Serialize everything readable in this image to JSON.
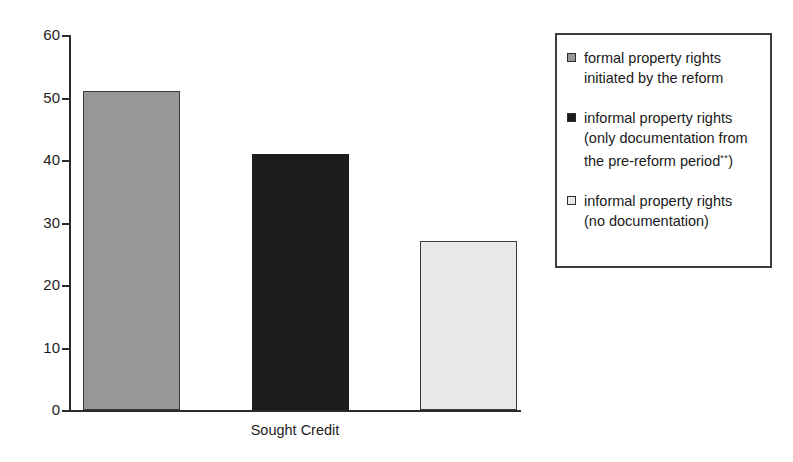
{
  "chart_data": {
    "type": "bar",
    "title": "",
    "subtitle": "",
    "xlabel": "Sought Credit",
    "ylabel": "",
    "categories": [
      "Sought Credit"
    ],
    "ylim": [
      0,
      60
    ],
    "yticks": [
      0,
      10,
      20,
      30,
      40,
      50,
      60
    ],
    "ytick_labels": [
      "0",
      "10",
      "20",
      "30",
      "40",
      "50",
      "60"
    ],
    "grid": false,
    "legend_position": "right",
    "series": [
      {
        "name": "formal property rights initiated by the reform",
        "values": [
          51
        ],
        "color": "#989898",
        "border_color": "#3a3a3a"
      },
      {
        "name": "informal property rights (only documentation from the pre-reform period**)",
        "values": [
          41
        ],
        "color": "#1c1c1c",
        "border_color": "#1c1c1c"
      },
      {
        "name": "informal property rights (no documentation)",
        "values": [
          27
        ],
        "color": "#e8e8e8",
        "border_color": "#3a3a3a"
      }
    ]
  },
  "axis": {
    "x_title": "Sought Credit",
    "y_tick_0": "0",
    "y_tick_10": "10",
    "y_tick_20": "20",
    "y_tick_30": "30",
    "y_tick_40": "40",
    "y_tick_50": "50",
    "y_tick_60": "60"
  },
  "legend": {
    "entries": [
      {
        "swatch": "#989898",
        "line1": "formal property rights",
        "line2": "initiated by the reform",
        "line3": "",
        "sup": ""
      },
      {
        "swatch": "#1c1c1c",
        "line1": "informal property rights",
        "line2": "(only documentation from",
        "line3": "the pre-reform period",
        "sup": "**",
        "line3_tail": ")"
      },
      {
        "swatch": "#e8e8e8",
        "line1": "informal property rights",
        "line2": "(no documentation)",
        "line3": "",
        "sup": ""
      }
    ]
  }
}
